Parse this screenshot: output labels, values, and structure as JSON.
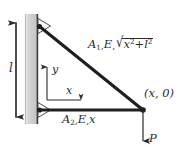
{
  "figure": {
    "width": 182,
    "height": 150,
    "background": "#ffffff",
    "ink_color": "#2b2b2b",
    "wall_fill": "#cfcfcf"
  },
  "labels": {
    "member_1": {
      "area": "A",
      "area_sub": "1",
      "modulus": "E",
      "length_expr_prefix": "√",
      "radicand_x": "x",
      "radicand_x_sup": "2",
      "radicand_plus": "+",
      "radicand_l": "l",
      "radicand_l_sup": "2",
      "comma": ","
    },
    "member_2": {
      "area": "A",
      "area_sub": "2",
      "modulus": "E",
      "length": "x",
      "comma": ","
    },
    "node_right": "(x, 0)",
    "load": "P",
    "length_dimension": "l",
    "axis_y": "y",
    "axis_x": "x"
  },
  "geometry": {
    "wall_x_left": 25,
    "wall_x_right": 38,
    "wall_y_top": 14,
    "wall_y_bottom": 124,
    "node_top": [
      38,
      26
    ],
    "node_bottom_left": [
      38,
      110
    ],
    "node_right": [
      143,
      110
    ],
    "load_arrow_end": [
      143,
      142
    ],
    "dimension_line_x": 16,
    "dimension_y_top": 22,
    "dimension_y_bottom": 118,
    "axis_origin": [
      47,
      100
    ],
    "axis_y_tip": [
      47,
      66
    ],
    "axis_x_tip": [
      82,
      100
    ]
  }
}
